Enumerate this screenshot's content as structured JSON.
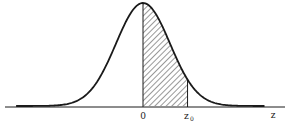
{
  "figure": {
    "distribution": "standard normal",
    "mean": 0,
    "std": 1,
    "shaded_from": 0,
    "shaded_to": 1.65,
    "x_range": [
      -4.7,
      4.5
    ],
    "shading": "diagonal hatch",
    "line_color": "#1a1a1a"
  },
  "labels": {
    "origin": "0",
    "z0_main": "z",
    "z0_sub": "0",
    "axis": "z"
  }
}
